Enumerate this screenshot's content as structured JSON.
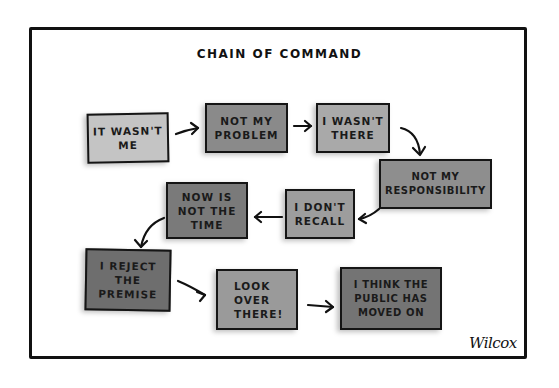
{
  "cartoon": {
    "title": "CHAIN OF COMMAND",
    "signature": "Wilcox",
    "boxes": [
      {
        "id": "it-wasnt-me",
        "lines": [
          "IT WASN'T",
          "ME"
        ],
        "fill": "#c4c4c4"
      },
      {
        "id": "not-my-problem",
        "lines": [
          "NOT MY",
          "PROBLEM"
        ],
        "fill": "#8a8a8a"
      },
      {
        "id": "i-wasnt-there",
        "lines": [
          "I WASN'T",
          "THERE"
        ],
        "fill": "#a9a9a9"
      },
      {
        "id": "not-my-responsibility",
        "lines": [
          "NOT MY",
          "RESPONSIBILITY"
        ],
        "fill": "#8e8e8e"
      },
      {
        "id": "i-dont-recall",
        "lines": [
          "I DON'T",
          "RECALL"
        ],
        "fill": "#9d9d9d"
      },
      {
        "id": "now-is-not-the-time",
        "lines": [
          "NOW IS",
          "NOT THE",
          "TIME"
        ],
        "fill": "#7a7a7a"
      },
      {
        "id": "i-reject-the-premise",
        "lines": [
          "I REJECT",
          "THE",
          "PREMISE"
        ],
        "fill": "#6e6e6e"
      },
      {
        "id": "look-over-there",
        "lines": [
          "LOOK",
          "OVER",
          "THERE!"
        ],
        "fill": "#9a9a9a"
      },
      {
        "id": "i-think-the-public-has-moved-on",
        "lines": [
          "I THINK THE",
          "PUBLIC HAS",
          "MOVED ON"
        ],
        "fill": "#747474"
      }
    ]
  }
}
